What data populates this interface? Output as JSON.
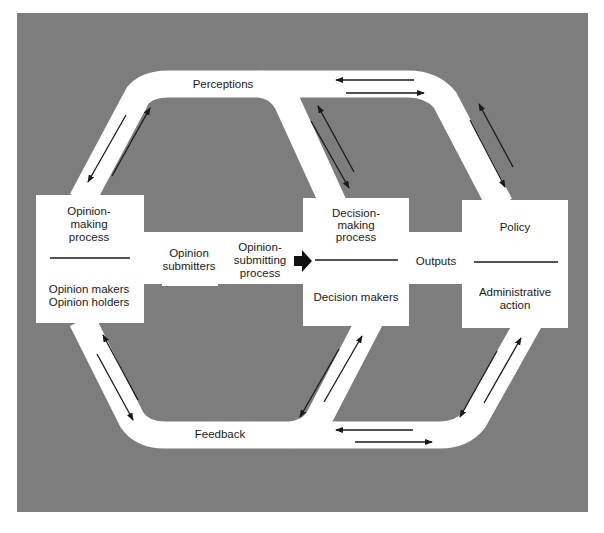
{
  "diagram": {
    "colors": {
      "page_bg": "#ffffff",
      "panel_bg": "#7d7d7d",
      "path_fill": "#ffffff",
      "arrow": "#1a1a1a",
      "text": "#1a1a1a"
    },
    "channels": {
      "top": "Perceptions",
      "bottom": "Feedback"
    },
    "nodes": {
      "opinion_making": {
        "top_lines": [
          "Opinion-",
          "making",
          "process"
        ],
        "bottom_lines": [
          "Opinion makers",
          "Opinion holders"
        ]
      },
      "opinion_submitters": {
        "lines": [
          "Opinion",
          "submitters"
        ]
      },
      "opinion_submitting": {
        "lines": [
          "Opinion-",
          "submitting",
          "process"
        ]
      },
      "decision_making": {
        "top_lines": [
          "Decision-",
          "making",
          "process"
        ],
        "bottom_lines": [
          "Decision makers"
        ]
      },
      "outputs": {
        "label": "Outputs"
      },
      "policy": {
        "top_lines": [
          "Policy"
        ],
        "bottom_lines": [
          "Administrative",
          "action"
        ]
      }
    },
    "flows": [
      {
        "from": "opinion_submitting",
        "to": "decision_making",
        "style": "bold-arrow"
      },
      {
        "channel": "Perceptions",
        "style": "bidirectional"
      },
      {
        "channel": "Feedback",
        "style": "bidirectional"
      }
    ]
  }
}
